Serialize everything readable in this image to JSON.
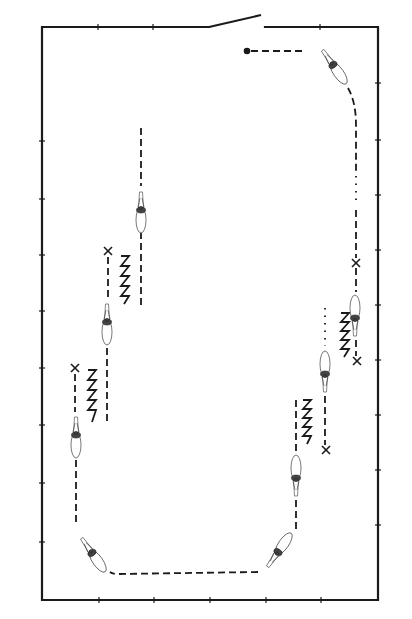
{
  "diagram": {
    "type": "arena-riding-pattern",
    "colors": {
      "ink": "#1a1a1a",
      "background": "#ffffff",
      "horse_outline": "#555555"
    },
    "arena": {
      "left": 42,
      "top": 27,
      "right": 378,
      "bottom": 600,
      "gate": {
        "wall": "top",
        "gap_from_x": 209,
        "gap_to_x": 265,
        "gate_open_end": [
          261,
          15
        ]
      }
    },
    "start_marker": {
      "shape": "filled-dot",
      "x": 247,
      "y": 51
    },
    "horses": [
      {
        "id": "horse-1",
        "x": 333,
        "y": 63,
        "heading_deg": 145
      },
      {
        "id": "horse-2",
        "x": 355,
        "y": 318,
        "heading_deg": 180
      },
      {
        "id": "horse-3",
        "x": 325,
        "y": 372,
        "heading_deg": 180
      },
      {
        "id": "horse-4",
        "x": 296,
        "y": 478,
        "heading_deg": 180
      },
      {
        "id": "horse-5",
        "x": 277,
        "y": 552,
        "heading_deg": 215
      },
      {
        "id": "horse-6",
        "x": 92,
        "y": 552,
        "heading_deg": 145
      },
      {
        "id": "horse-7",
        "x": 76,
        "y": 435,
        "heading_deg": 0
      },
      {
        "id": "horse-8",
        "x": 107,
        "y": 320,
        "heading_deg": 0
      },
      {
        "id": "horse-9",
        "x": 141,
        "y": 208,
        "heading_deg": 0
      }
    ],
    "x_markers": [
      {
        "id": "x-1",
        "x": 356,
        "y": 263
      },
      {
        "id": "x-2",
        "x": 357,
        "y": 361
      },
      {
        "id": "x-3",
        "x": 326,
        "y": 450
      },
      {
        "id": "x-4",
        "x": 75,
        "y": 368
      },
      {
        "id": "x-5",
        "x": 108,
        "y": 251
      }
    ],
    "zigzags": [
      {
        "id": "zigzag-1",
        "x": 344,
        "y": 313,
        "height": 44
      },
      {
        "id": "zigzag-2",
        "x": 306,
        "y": 400,
        "height": 44
      },
      {
        "id": "zigzag-3",
        "x": 91,
        "y": 370,
        "height": 52
      },
      {
        "id": "zigzag-4",
        "x": 124,
        "y": 256,
        "height": 48
      }
    ],
    "legend": {
      "filled-dot": "start point",
      "dashed-line": "track ridden",
      "dotted-line": "transition segment",
      "x": "marker point",
      "zigzag": "lateral movement / leg-yield"
    }
  }
}
